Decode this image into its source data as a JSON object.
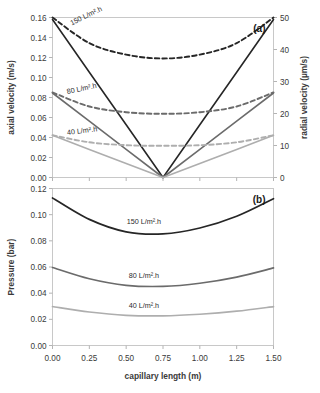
{
  "figure": {
    "panel_a_label": "(a)",
    "panel_b_label": "(b)"
  },
  "chart_data": [
    {
      "type": "line",
      "title": "(a)",
      "xlabel": "",
      "ylabel": "axial velocity (m/s)",
      "y2label": "radial velocity (µm/s)",
      "xlim": [
        0.0,
        1.5
      ],
      "ylim": [
        0.0,
        0.16
      ],
      "y2lim": [
        0,
        50
      ],
      "xticks": [
        "0.00",
        "0.25",
        "0.50",
        "0.75",
        "1.00",
        "1.25",
        "1.50"
      ],
      "yticks": [
        "0.00",
        "0.02",
        "0.04",
        "0.06",
        "0.08",
        "0.10",
        "0.12",
        "0.14",
        "0.16"
      ],
      "y2ticks": [
        "0",
        "10",
        "20",
        "30",
        "40",
        "50"
      ],
      "grid": false,
      "legend_position": "inline-annotations",
      "x": [
        0.0,
        0.25,
        0.5,
        0.75,
        1.0,
        1.25,
        1.5
      ],
      "series": [
        {
          "name": "150 L/m².h",
          "axis": "left",
          "style": "solid",
          "color": "#262626",
          "quantity": "axial velocity",
          "values": [
            0.158,
            0.1053,
            0.0527,
            0.0,
            0.0527,
            0.1053,
            0.158
          ]
        },
        {
          "name": "80 L/m².h",
          "axis": "left",
          "style": "solid",
          "color": "#6b6b6b",
          "quantity": "axial velocity",
          "values": [
            0.0845,
            0.0563,
            0.0282,
            0.0,
            0.0282,
            0.0563,
            0.0845
          ]
        },
        {
          "name": "40 L/m².h",
          "axis": "left",
          "style": "solid",
          "color": "#aeaeae",
          "quantity": "axial velocity",
          "values": [
            0.0422,
            0.0281,
            0.0141,
            0.0,
            0.0141,
            0.0281,
            0.0422
          ]
        },
        {
          "name": "150 L/m².h",
          "axis": "right",
          "style": "dashed",
          "color": "#262626",
          "quantity": "radial velocity",
          "values": [
            50.0,
            42.0,
            38.4,
            37.2,
            38.4,
            42.0,
            50.0
          ]
        },
        {
          "name": "80 L/m².h",
          "axis": "right",
          "style": "dashed",
          "color": "#6b6b6b",
          "quantity": "radial velocity",
          "values": [
            26.6,
            22.2,
            20.4,
            19.9,
            20.4,
            22.2,
            26.6
          ]
        },
        {
          "name": "40 L/m².h",
          "axis": "right",
          "style": "dashed",
          "color": "#aeaeae",
          "quantity": "radial velocity",
          "values": [
            13.2,
            11.0,
            10.1,
            9.9,
            10.1,
            11.0,
            13.2
          ]
        }
      ],
      "annotations": [
        {
          "text": "150 L/m².h",
          "x": 0.13,
          "y": 0.152,
          "rotation": -26
        },
        {
          "text": "80 L/m².h",
          "x": 0.1,
          "y": 0.0835,
          "rotation": -12
        },
        {
          "text": "40 L/m².h",
          "x": 0.1,
          "y": 0.0425,
          "rotation": -7
        }
      ]
    },
    {
      "type": "line",
      "title": "(b)",
      "xlabel": "capillary length (m)",
      "ylabel": "Pressure (bar)",
      "xlim": [
        0.0,
        1.5
      ],
      "ylim": [
        0.0,
        0.12
      ],
      "xticks": [
        "0.00",
        "0.25",
        "0.50",
        "0.75",
        "1.00",
        "1.25",
        "1.50"
      ],
      "yticks": [
        "0.00",
        "0.02",
        "0.04",
        "0.06",
        "0.08",
        "0.10",
        "0.12"
      ],
      "grid": false,
      "legend_position": "inline-annotations",
      "x": [
        0.0,
        0.25,
        0.5,
        0.75,
        1.0,
        1.25,
        1.5
      ],
      "series": [
        {
          "name": "150 L/m².h",
          "style": "solid",
          "color": "#262626",
          "values": [
            0.1128,
            0.0964,
            0.0869,
            0.0853,
            0.0898,
            0.0988,
            0.1122
          ]
        },
        {
          "name": "80 L/m².h",
          "style": "solid",
          "color": "#6b6b6b",
          "values": [
            0.0596,
            0.051,
            0.046,
            0.0452,
            0.0476,
            0.0523,
            0.0593
          ]
        },
        {
          "name": "40 L/m².h",
          "style": "solid",
          "color": "#aeaeae",
          "values": [
            0.0298,
            0.0256,
            0.0231,
            0.0227,
            0.0239,
            0.0262,
            0.0297
          ]
        }
      ],
      "annotations": [
        {
          "text": "150 L/m².h",
          "x": 0.62,
          "y": 0.0925,
          "rotation": 0
        },
        {
          "text": "80 L/m².h",
          "x": 0.62,
          "y": 0.0515,
          "rotation": 0
        },
        {
          "text": "40 L/m².h",
          "x": 0.62,
          "y": 0.0285,
          "rotation": 0
        }
      ]
    }
  ]
}
